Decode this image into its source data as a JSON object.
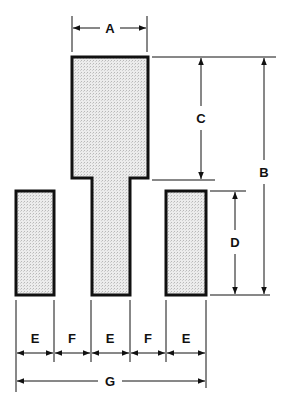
{
  "diagram": {
    "type": "dimensioned pad layout",
    "colors": {
      "stroke": "#111111",
      "fill": "#e4e4e4",
      "background": "#ffffff"
    },
    "shapes": [
      {
        "name": "center-component",
        "description": "T-shaped pad: wide head with narrow stem"
      },
      {
        "name": "left-pad",
        "description": "rectangular pad"
      },
      {
        "name": "right-pad",
        "description": "rectangular pad"
      }
    ],
    "dimensions": {
      "A": {
        "label": "A",
        "meaning": "width of center head"
      },
      "B": {
        "label": "B",
        "meaning": "total height of center component"
      },
      "C": {
        "label": "C",
        "meaning": "height of center head"
      },
      "D": {
        "label": "D",
        "meaning": "height of side pads"
      },
      "E1": {
        "label": "E",
        "meaning": "width of left pad"
      },
      "F1": {
        "label": "F",
        "meaning": "gap between left pad and stem"
      },
      "E2": {
        "label": "E",
        "meaning": "width of center stem"
      },
      "F2": {
        "label": "F",
        "meaning": "gap between stem and right pad"
      },
      "E3": {
        "label": "E",
        "meaning": "width of right pad"
      },
      "G": {
        "label": "G",
        "meaning": "overall width"
      }
    }
  }
}
